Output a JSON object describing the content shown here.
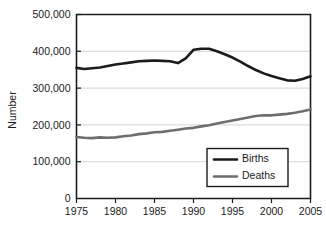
{
  "chart_data": {
    "type": "line",
    "title": "",
    "xlabel": "",
    "ylabel": "Number",
    "xlim": [
      1975,
      2005
    ],
    "ylim": [
      0,
      500000
    ],
    "grid": true,
    "legend_position": "lower-right",
    "x_ticks": [
      "1975",
      "1980",
      "1985",
      "1990",
      "1995",
      "2000",
      "2005"
    ],
    "x_tick_values": [
      1975,
      1980,
      1985,
      1990,
      1995,
      2000,
      2005
    ],
    "y_ticks": [
      "0",
      "100,000",
      "200,000",
      "300,000",
      "400,000",
      "500,000"
    ],
    "y_tick_values": [
      0,
      100000,
      200000,
      300000,
      400000,
      500000
    ],
    "x": [
      1975,
      1976,
      1977,
      1978,
      1979,
      1980,
      1981,
      1982,
      1983,
      1984,
      1985,
      1986,
      1987,
      1988,
      1989,
      1990,
      1991,
      1992,
      1993,
      1994,
      1995,
      1996,
      1997,
      1998,
      1999,
      2000,
      2001,
      2002,
      2003,
      2004,
      2005
    ],
    "series": [
      {
        "name": "Births",
        "color": "#1b1b1b",
        "width": 2.6,
        "values": [
          355000,
          352000,
          354000,
          356000,
          360000,
          364000,
          367000,
          370000,
          373000,
          374000,
          375000,
          374000,
          373000,
          368000,
          381000,
          404000,
          407000,
          407000,
          400000,
          392000,
          383000,
          372000,
          360000,
          349000,
          340000,
          333000,
          327000,
          321000,
          320000,
          325000,
          332000
        ]
      },
      {
        "name": "Deaths",
        "color": "#6e6e6e",
        "width": 2.6,
        "values": [
          167000,
          165000,
          164000,
          166000,
          165000,
          166000,
          169000,
          171000,
          175000,
          177000,
          180000,
          181000,
          184000,
          187000,
          190000,
          192000,
          196000,
          199000,
          204000,
          208000,
          212000,
          216000,
          220000,
          224000,
          226000,
          226000,
          228000,
          230000,
          233000,
          237000,
          242000
        ]
      }
    ],
    "legend": [
      {
        "label": "Births",
        "color": "#1b1b1b"
      },
      {
        "label": "Deaths",
        "color": "#6e6e6e"
      }
    ]
  },
  "colors": {
    "background": "#ffffff",
    "axis": "#1b1b1b",
    "gridline": "#c9c9c9",
    "births": "#1b1b1b",
    "deaths": "#6e6e6e"
  }
}
